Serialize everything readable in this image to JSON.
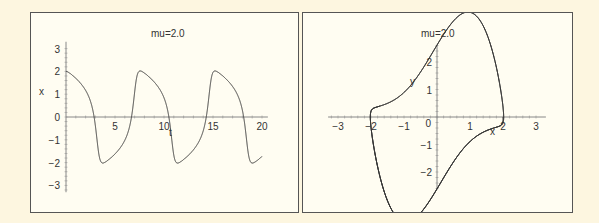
{
  "chart_data": [
    {
      "type": "line",
      "title": "mu=2.0",
      "xlabel": "t",
      "ylabel": "x",
      "xlim": [
        0,
        20
      ],
      "ylim": [
        -3,
        3
      ],
      "x_ticks": [
        "5",
        "10",
        "15",
        "20"
      ],
      "y_ticks": [
        "-3",
        "-2",
        "-1",
        "0",
        "1",
        "2",
        "3"
      ],
      "grid": false,
      "series": [
        {
          "name": "x(t)",
          "description": "Van der Pol oscillator solution, mu=2.0, x(0)=2, y(0)=0",
          "t": [
            0,
            1,
            2,
            3,
            3.5,
            4,
            5,
            6,
            7,
            7.6,
            8,
            9,
            10,
            11,
            11.3,
            12,
            13,
            14,
            15,
            15.2,
            16,
            17,
            18,
            18.9,
            19.5,
            20
          ],
          "x": [
            2.0,
            1.6,
            0.3,
            -1.9,
            -2.6,
            -2.4,
            -0.8,
            1.2,
            2.4,
            2.6,
            2.3,
            0.6,
            -1.6,
            -2.5,
            -2.6,
            -2.1,
            0.0,
            1.9,
            2.6,
            2.6,
            1.6,
            -0.6,
            -2.2,
            -2.6,
            -2.0,
            -0.9
          ]
        }
      ]
    },
    {
      "type": "line",
      "title": "mu=2.0",
      "xlabel": "x",
      "ylabel": "y",
      "xlim": [
        -3,
        3
      ],
      "ylim": [
        -2.5,
        2.5
      ],
      "x_ticks": [
        "-3",
        "-2",
        "-1",
        "0",
        "1",
        "2",
        "3"
      ],
      "y_ticks": [
        "-2",
        "-1",
        "0",
        "1",
        "2"
      ],
      "grid": false,
      "series": [
        {
          "name": "phase portrait (x, y)",
          "description": "Van der Pol limit cycle starting at (2, 0)",
          "x": [
            2.0,
            1.8,
            1.2,
            0.0,
            -1.0,
            -2.0,
            -2.6,
            -2.6,
            -2.2,
            -1.5,
            0.0,
            1.0,
            2.0,
            2.6,
            2.6,
            2.3,
            1.5
          ],
          "y": [
            0.0,
            -1.2,
            -1.8,
            -1.75,
            -1.55,
            -1.1,
            -0.2,
            0.5,
            1.8,
            2.0,
            1.8,
            1.6,
            1.2,
            0.3,
            -0.5,
            -1.8,
            -2.0
          ]
        }
      ]
    }
  ],
  "plots": {
    "left": {
      "title": "mu=2.0",
      "xlabel": "t",
      "ylabel": "x",
      "mu": 2.0,
      "x0": 2.0,
      "y0": 0.0,
      "tmax": 20,
      "line_color": "#333333"
    },
    "right": {
      "title": "mu=2.0",
      "xlabel": "x",
      "ylabel": "y",
      "line_color": "#333333"
    }
  },
  "colors": {
    "background": "#fdf6e0",
    "panel": "#fffdf2",
    "border": "#555555",
    "axis": "#888888",
    "curve": "#333333",
    "text": "#333333"
  }
}
